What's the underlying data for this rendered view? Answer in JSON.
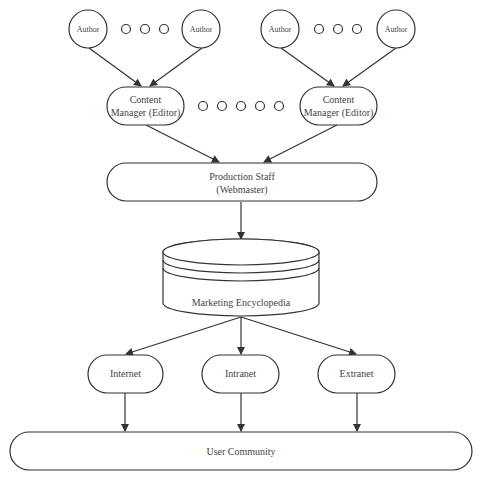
{
  "diagram": {
    "type": "flowchart",
    "nodes": {
      "author_1": {
        "label": "Author"
      },
      "author_2": {
        "label": "Author"
      },
      "author_3": {
        "label": "Author"
      },
      "author_4": {
        "label": "Author"
      },
      "editor_left": {
        "line1": "Content",
        "line2": "Manager (Editor)"
      },
      "editor_right": {
        "line1": "Content",
        "line2": "Manager (Editor)"
      },
      "production": {
        "line1": "Production Staff",
        "line2": "(Webmaster)"
      },
      "encyclopedia": {
        "label": "Marketing Encyclopedia"
      },
      "internet": {
        "label": "Internet"
      },
      "intranet": {
        "label": "Intranet"
      },
      "extranet": {
        "label": "Extranet"
      },
      "community": {
        "label": "User Community"
      }
    },
    "edges": [
      {
        "from": "author_1",
        "to": "editor_left"
      },
      {
        "from": "author_2",
        "to": "editor_left"
      },
      {
        "from": "author_3",
        "to": "editor_right"
      },
      {
        "from": "author_4",
        "to": "editor_right"
      },
      {
        "from": "editor_left",
        "to": "production"
      },
      {
        "from": "editor_right",
        "to": "production"
      },
      {
        "from": "production",
        "to": "encyclopedia"
      },
      {
        "from": "encyclopedia",
        "to": "internet"
      },
      {
        "from": "encyclopedia",
        "to": "intranet"
      },
      {
        "from": "encyclopedia",
        "to": "extranet"
      },
      {
        "from": "internet",
        "to": "community"
      },
      {
        "from": "intranet",
        "to": "community"
      },
      {
        "from": "extranet",
        "to": "community"
      }
    ],
    "ellipsis_groups": [
      {
        "between": [
          "author_1",
          "author_2"
        ],
        "count": 3
      },
      {
        "between": [
          "author_3",
          "author_4"
        ],
        "count": 3
      },
      {
        "between": [
          "editor_left",
          "editor_right"
        ],
        "count": 5
      }
    ],
    "colors": {
      "stroke": "#333333",
      "text": "#444444",
      "background": "#ffffff"
    }
  }
}
